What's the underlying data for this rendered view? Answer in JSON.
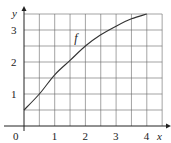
{
  "chart_data": {
    "type": "line",
    "title": "",
    "xlabel": "x",
    "ylabel": "y",
    "xlim": [
      0,
      4.5
    ],
    "ylim": [
      0,
      3.5
    ],
    "grid": true,
    "grid_step": 0.5,
    "x_ticks": [
      "0",
      "1",
      "2",
      "3",
      "4"
    ],
    "y_ticks": [
      "1",
      "2",
      "3"
    ],
    "series": [
      {
        "name": "f",
        "x": [
          0,
          0.5,
          1,
          1.5,
          2,
          2.5,
          3,
          3.5,
          4
        ],
        "y": [
          0.5,
          1.0,
          1.6,
          2.05,
          2.5,
          2.85,
          3.12,
          3.35,
          3.5
        ]
      }
    ],
    "annotations": [
      {
        "text": "f",
        "x": 1.7,
        "y": 2.75
      }
    ]
  }
}
